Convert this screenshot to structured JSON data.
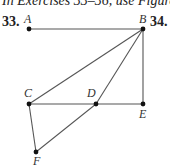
{
  "header": {
    "text": "In Exercises 33–36, use Figure 3 A"
  },
  "exercises": [
    {
      "label": "33."
    },
    {
      "label": "34."
    }
  ],
  "diagram": {
    "points": {
      "A": {
        "label": "A",
        "x": 29,
        "y": 29
      },
      "B": {
        "label": "B",
        "x": 143,
        "y": 29
      },
      "C": {
        "label": "C",
        "x": 29,
        "y": 104
      },
      "D": {
        "label": "D",
        "x": 96,
        "y": 104
      },
      "E": {
        "label": "E",
        "x": 143,
        "y": 104
      },
      "F": {
        "label": "F",
        "x": 36,
        "y": 152
      }
    },
    "segments": [
      "AB",
      "BC",
      "BD",
      "BE",
      "CE",
      "CF",
      "DF"
    ],
    "line_color": "#555555",
    "point_color": "#111111"
  }
}
